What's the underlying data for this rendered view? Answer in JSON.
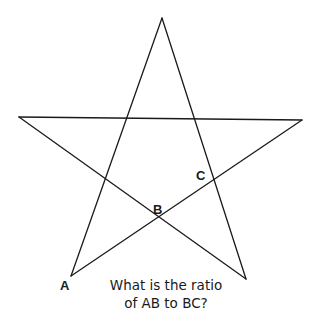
{
  "diagram": {
    "type": "pentagram",
    "stroke_color": "#1a1a1a",
    "vertices": {
      "top": [
        162,
        18
      ],
      "left": [
        19,
        117
      ],
      "right": [
        302,
        120
      ],
      "bottom_left": [
        71,
        276
      ],
      "bottom_right": [
        246,
        279
      ]
    },
    "points": [
      {
        "name": "A",
        "label": "A",
        "x": 71,
        "y": 276,
        "label_x": 60,
        "label_y": 290
      },
      {
        "name": "B",
        "label": "B",
        "x": 159,
        "y": 219,
        "label_x": 153,
        "label_y": 214
      },
      {
        "name": "C",
        "label": "C",
        "x": 214,
        "y": 181,
        "label_x": 196,
        "label_y": 180
      }
    ],
    "question": {
      "line1": "What is the ratio",
      "line2": "of AB to BC?"
    }
  }
}
